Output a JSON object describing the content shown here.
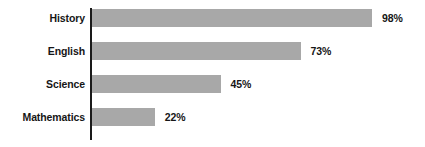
{
  "chart_data": {
    "type": "bar",
    "orientation": "horizontal",
    "title": "",
    "subtitle": "",
    "xlabel": "",
    "ylabel": "",
    "categories": [
      "History",
      "English",
      "Science",
      "Mathematics"
    ],
    "values": [
      98,
      73,
      45,
      22
    ],
    "value_labels": [
      "98%",
      "73%",
      "45%",
      "22%"
    ],
    "unit": "%",
    "xlim": [
      0,
      100
    ],
    "grid": false,
    "legend": null,
    "bar_color": "#a8a8a8",
    "axis_color": "#1a1a1a",
    "text_color": "#161616",
    "background_color": "#ffffff"
  }
}
